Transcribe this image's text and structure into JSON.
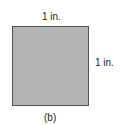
{
  "figure": {
    "caption": "(b)",
    "shape": "square",
    "fill_color": "#b3b3b3",
    "border_color": "#555555",
    "top_label": "1 in.",
    "right_label": "1 in."
  }
}
